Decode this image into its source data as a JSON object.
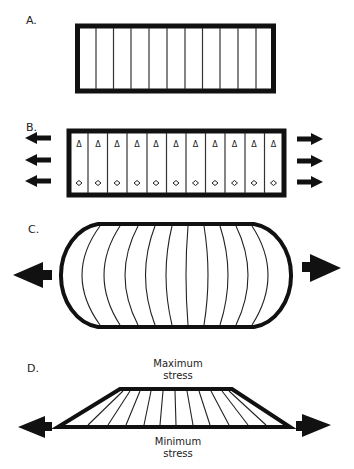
{
  "panels": {
    "a": {
      "label": "A.",
      "fiber_count": 11
    },
    "b": {
      "label": "B.",
      "triangle_glyph": "Δ",
      "diamond_glyph": "◇",
      "fiber_count": 11,
      "arrows_per_side": 3
    },
    "c": {
      "label": "C.",
      "fiber_count": 11
    },
    "d": {
      "label": "D.",
      "top_label_line1": "Maximum",
      "top_label_line2": "stress",
      "bottom_label_line1": "Minimum",
      "bottom_label_line2": "stress"
    }
  },
  "colors": {
    "stroke": "#111111",
    "background": "#ffffff"
  }
}
